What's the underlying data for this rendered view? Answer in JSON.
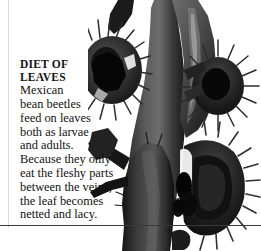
{
  "document": {
    "type": "photo-caption-page",
    "background_color": "#ffffff",
    "rules": {
      "left_margin_rule_color": "#d9d9d9",
      "bottom_rule_color": "#3a3a3a"
    }
  },
  "caption": {
    "heading": "DIET OF\nLEAVES",
    "body": "Mexican\nbean beetles\nfeed on leaves\nboth as larvae\nand adults.\nBecause they only\neat the fleshy parts\nbetween the veins,\nthe leaf becomes\nnetted and lacy.",
    "text_color": "#111111"
  },
  "photograph": {
    "subject": "bean plant stem with spiny beetle-eaten leaves",
    "palette": {
      "darkest": "#0a0a0a",
      "dark": "#1f1f1f",
      "mid": "#3d3d3d",
      "mid_light": "#585858",
      "light": "#777777",
      "highlight": "#b8b8b8",
      "background": "#ffffff"
    }
  }
}
